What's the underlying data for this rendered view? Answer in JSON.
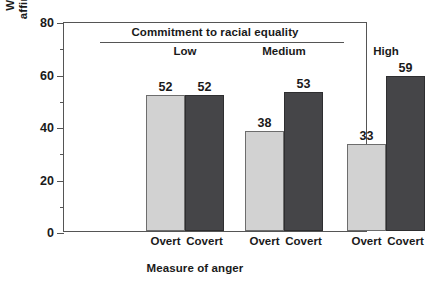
{
  "chart_data": {
    "type": "bar",
    "title": "",
    "header_label": "Commitment to racial equality",
    "categories": [
      "Low",
      "Medium",
      "High"
    ],
    "subcategories": [
      "Overt",
      "Covert"
    ],
    "series": [
      {
        "name": "Overt",
        "values": [
          52,
          38,
          33
        ],
        "color": "#d2d2d2"
      },
      {
        "name": "Covert",
        "values": [
          52,
          53,
          59
        ],
        "color": "#454548"
      }
    ],
    "xlabel": "Measure of anger",
    "ylabel": "Whites angry over affirmative action (%)",
    "ylabel_line1": "Whites angry over",
    "ylabel_line2": "affirmative action (%)",
    "ylim": [
      0,
      80
    ],
    "yticks": [
      0,
      20,
      40,
      60,
      80
    ],
    "ytick_labels": [
      "0",
      "20",
      "40",
      "60",
      "80"
    ],
    "yminor_ticks": [
      10,
      30,
      50,
      70
    ],
    "grid": false,
    "legend": "none",
    "bars": [
      {
        "group": "Low",
        "subcategory": "Overt",
        "value": 52,
        "label": "52",
        "style": "light"
      },
      {
        "group": "Low",
        "subcategory": "Covert",
        "value": 52,
        "label": "52",
        "style": "dark"
      },
      {
        "group": "Medium",
        "subcategory": "Overt",
        "value": 38,
        "label": "38",
        "style": "light"
      },
      {
        "group": "Medium",
        "subcategory": "Covert",
        "value": 53,
        "label": "53",
        "style": "dark"
      },
      {
        "group": "High",
        "subcategory": "Overt",
        "value": 33,
        "label": "33",
        "style": "light"
      },
      {
        "group": "High",
        "subcategory": "Covert",
        "value": 59,
        "label": "59",
        "style": "dark"
      }
    ]
  }
}
